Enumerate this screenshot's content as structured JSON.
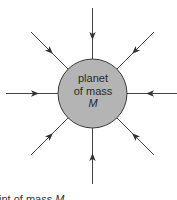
{
  "diagram": {
    "planet": {
      "label_line1": "planet",
      "label_line2": "of mass",
      "label_line3": "M",
      "center": [
        92.5,
        93.5
      ],
      "radius": 34.5,
      "fill_color": "#b4b4b4",
      "stroke_color": "#3a3a3a"
    },
    "field_lines": [
      {
        "direction": "north",
        "from": [
          92.5,
          8
        ],
        "to": [
          92.5,
          59
        ],
        "arrow": [
          92.5,
          36
        ]
      },
      {
        "direction": "north-east",
        "from": [
          154,
          32
        ],
        "to": [
          117,
          69
        ],
        "arrow": [
          135,
          51
        ]
      },
      {
        "direction": "east",
        "from": [
          177,
          93.5
        ],
        "to": [
          127,
          93.5
        ],
        "arrow": [
          150,
          93.5
        ]
      },
      {
        "direction": "south-east",
        "from": [
          154,
          155
        ],
        "to": [
          117,
          118
        ],
        "arrow": [
          135,
          136
        ]
      },
      {
        "direction": "south",
        "from": [
          92.5,
          184
        ],
        "to": [
          92.5,
          128
        ],
        "arrow": [
          92.5,
          157
        ]
      },
      {
        "direction": "south-west",
        "from": [
          31,
          155
        ],
        "to": [
          68,
          118
        ],
        "arrow": [
          50,
          136
        ]
      },
      {
        "direction": "west",
        "from": [
          6,
          93.5
        ],
        "to": [
          58,
          93.5
        ],
        "arrow": [
          35,
          93.5
        ]
      },
      {
        "direction": "north-west",
        "from": [
          31,
          32
        ],
        "to": [
          68,
          69
        ],
        "arrow": [
          50,
          51
        ]
      }
    ],
    "line_color": "#444444",
    "caption_prefix": "int of mass ",
    "caption_symbol": "M"
  }
}
